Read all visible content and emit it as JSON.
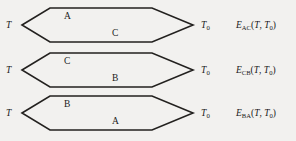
{
  "figure": {
    "background_color": "#f2f1ef",
    "line_color": "#23211f",
    "text_color": "#1a1a1a",
    "geometry": {
      "left_vertex_x": 22,
      "bend_left_x": 50,
      "bend_right_x": 152,
      "right_vertex_x": 193,
      "half_height": 17,
      "row_centers_y": [
        25,
        70,
        113
      ]
    },
    "rows": [
      {
        "id": "loop-ac",
        "top_y": 2,
        "hot_terminal": "T",
        "cold_terminal": "T",
        "cold_terminal_sub": "0",
        "upper_leg": "A",
        "lower_leg": "C",
        "emf": {
          "symbol": "E",
          "subscript": "AC",
          "args": "(T, T0)",
          "arg1": "T",
          "arg2": "T",
          "arg2_sub": "0",
          "full_text": "E_AC(T, T0)"
        }
      },
      {
        "id": "loop-cb",
        "top_y": 47,
        "hot_terminal": "T",
        "cold_terminal": "T",
        "cold_terminal_sub": "0",
        "upper_leg": "C",
        "lower_leg": "B",
        "emf": {
          "symbol": "E",
          "subscript": "CB",
          "args": "(T, T0)",
          "arg1": "T",
          "arg2": "T",
          "arg2_sub": "0",
          "full_text": "E_CB(T, T0)"
        }
      },
      {
        "id": "loop-ba",
        "top_y": 90,
        "hot_terminal": "T",
        "cold_terminal": "T",
        "cold_terminal_sub": "0",
        "upper_leg": "B",
        "lower_leg": "A",
        "emf": {
          "symbol": "E",
          "subscript": "BA",
          "args": "(T, T0)",
          "arg1": "T",
          "arg2": "T",
          "arg2_sub": "0",
          "full_text": "E_BA(T, T0)"
        }
      }
    ]
  }
}
